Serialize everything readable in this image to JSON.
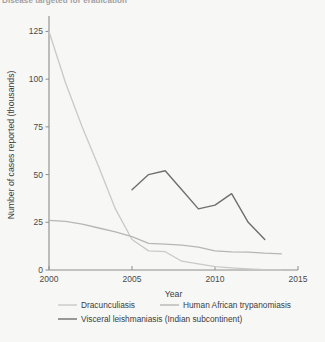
{
  "figure": {
    "cut_off_title": "Disease targeted for eradication",
    "background_color": "#f7f7f6"
  },
  "chart_data": {
    "type": "line",
    "title": "",
    "xlabel": "Year",
    "ylabel": "Number of cases reported (thousands)",
    "xlim": [
      2000,
      2015
    ],
    "ylim": [
      0,
      131
    ],
    "xticks": [
      2000,
      2005,
      2010,
      2015
    ],
    "xticklabels": [
      "2000",
      "2005",
      "2010",
      "2015"
    ],
    "yticks": [
      0,
      25,
      50,
      75,
      100,
      125
    ],
    "yticklabels": [
      "0",
      "25",
      "50",
      "75",
      "100",
      "125"
    ],
    "grid": false,
    "legend_position": "below",
    "series": [
      {
        "name": "Dracunculiasis",
        "color": "#c9c9c9",
        "linewidth": 1.3,
        "x": [
          2000,
          2001,
          2002,
          2003,
          2004,
          2005,
          2006,
          2007,
          2008,
          2009,
          2010,
          2011,
          2012,
          2013,
          2014
        ],
        "y": [
          125,
          98,
          75,
          54,
          32,
          16,
          10,
          9.6,
          4.6,
          3.2,
          1.8,
          1.1,
          0.6,
          0.2,
          0.1
        ]
      },
      {
        "name": "Human African trypanomiasis",
        "color": "#b6b6b6",
        "linewidth": 1.3,
        "x": [
          2000,
          2001,
          2002,
          2003,
          2004,
          2005,
          2006,
          2007,
          2008,
          2009,
          2010,
          2011,
          2012,
          2013,
          2014
        ],
        "y": [
          26,
          25.5,
          24,
          22,
          20,
          17.5,
          14,
          13.5,
          13,
          12,
          10,
          9.5,
          9.4,
          8.8,
          8.5
        ]
      },
      {
        "name": "Visceral leishmaniasis (Indian subcontinent)",
        "color": "#6f6f6f",
        "linewidth": 1.4,
        "x": [
          2005,
          2006,
          2007,
          2008,
          2009,
          2010,
          2011,
          2012,
          2013
        ],
        "y": [
          42,
          50,
          52,
          42,
          32,
          34,
          40,
          25,
          16
        ]
      }
    ]
  },
  "legend": {
    "items": [
      {
        "label": "Dracunculiasis",
        "color": "#c9c9c9"
      },
      {
        "label": "Human African trypanomiasis",
        "color": "#b6b6b6"
      },
      {
        "label": "Visceral leishmaniasis (Indian subcontinent)",
        "color": "#6f6f6f"
      }
    ]
  }
}
